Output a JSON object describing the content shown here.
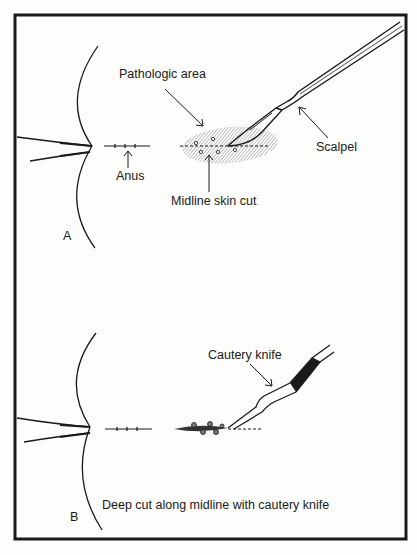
{
  "panel_a": {
    "letter": "A",
    "labels": {
      "pathologic_area": "Pathologic area",
      "anus": "Anus",
      "midline_skin_cut": "Midline skin cut",
      "scalpel": "Scalpel"
    }
  },
  "panel_b": {
    "letter": "B",
    "labels": {
      "cautery_knife": "Cautery knife",
      "caption": "Deep cut along midline with cautery knife"
    }
  },
  "colors": {
    "ink": "#1a1a1a",
    "paper": "#fdfdfb",
    "shading": "#9a9a9a"
  }
}
